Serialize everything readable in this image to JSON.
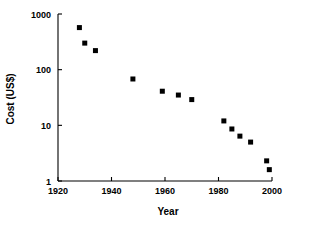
{
  "chart_data": {
    "type": "scatter",
    "title": "",
    "xlabel": "Year",
    "ylabel": "Cost (US$)",
    "xlim": [
      1920,
      2000
    ],
    "ylim": [
      1,
      1000
    ],
    "yscale": "log",
    "xscale": "linear",
    "grid": false,
    "legend": null,
    "legend_position": "none",
    "xticks": [
      1920,
      1940,
      1960,
      1980,
      2000
    ],
    "xtick_labels": [
      "1920",
      "1940",
      "1960",
      "1980",
      "2000"
    ],
    "yticks": [
      1,
      10,
      100,
      1000
    ],
    "ytick_labels": [
      "1",
      "10",
      "100",
      "1000"
    ],
    "marker": "square",
    "marker_color": "#000000",
    "marker_size": 5,
    "x": [
      1928,
      1930,
      1934,
      1948,
      1959,
      1965,
      1970,
      1982,
      1985,
      1988,
      1992,
      1998,
      1999
    ],
    "y": [
      570,
      300,
      220,
      68,
      41,
      35,
      29,
      12,
      8.6,
      6.4,
      5.0,
      2.3,
      1.6
    ],
    "points": [
      {
        "x": 1928,
        "y": 570
      },
      {
        "x": 1930,
        "y": 300
      },
      {
        "x": 1934,
        "y": 220
      },
      {
        "x": 1948,
        "y": 68
      },
      {
        "x": 1959,
        "y": 41
      },
      {
        "x": 1965,
        "y": 35
      },
      {
        "x": 1970,
        "y": 29
      },
      {
        "x": 1982,
        "y": 12
      },
      {
        "x": 1985,
        "y": 8.6
      },
      {
        "x": 1988,
        "y": 6.4
      },
      {
        "x": 1992,
        "y": 5.0
      },
      {
        "x": 1998,
        "y": 2.3
      },
      {
        "x": 1999,
        "y": 1.6
      }
    ]
  },
  "axes": {
    "x_title": "Year",
    "y_title": "Cost (US$)"
  }
}
